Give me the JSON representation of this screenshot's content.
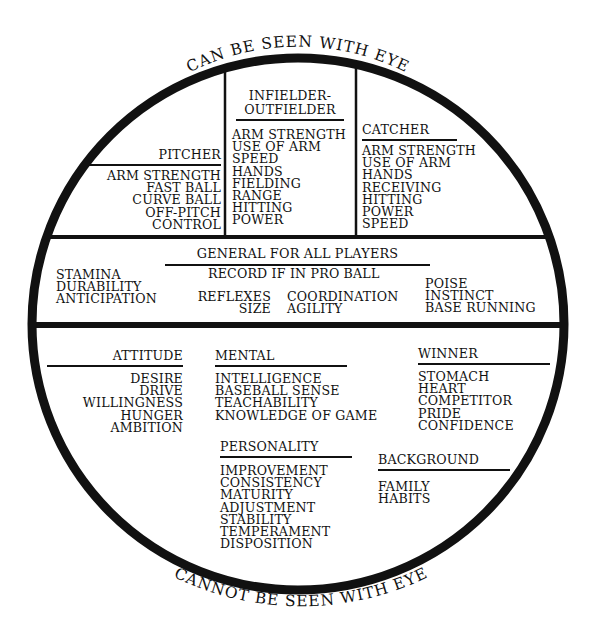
{
  "arc_labels": {
    "top": "CAN BE SEEN WITH EYE",
    "bottom": "CANNOT BE SEEN WITH EYE"
  },
  "top_section": {
    "pitcher": {
      "title": "PITCHER",
      "items": [
        "ARM STRENGTH",
        "FAST BALL",
        "CURVE BALL",
        "OFF-PITCH",
        "CONTROL"
      ]
    },
    "infielder_outfielder": {
      "title_line1": "INFIELDER-",
      "title_line2": "OUTFIELDER",
      "items": [
        "ARM STRENGTH",
        "USE OF ARM",
        "SPEED",
        "HANDS",
        "FIELDING",
        "RANGE",
        "HITTING",
        "POWER"
      ]
    },
    "catcher": {
      "title": "CATCHER",
      "items": [
        "ARM STRENGTH",
        "USE OF ARM",
        "HANDS",
        "RECEIVING",
        "HITTING",
        "POWER",
        "SPEED"
      ]
    }
  },
  "middle_section": {
    "title": "GENERAL FOR ALL PLAYERS",
    "left_items": [
      "STAMINA",
      "DURABILITY",
      "ANTICIPATION"
    ],
    "record": "RECORD IF IN PRO BALL",
    "center_left": [
      "REFLEXES",
      "SIZE"
    ],
    "center_right": [
      "COORDINATION",
      "AGILITY"
    ],
    "right_items": [
      "POISE",
      "INSTINCT",
      "BASE RUNNING"
    ]
  },
  "bottom_section": {
    "attitude": {
      "title": "ATTITUDE",
      "items": [
        "DESIRE",
        "DRIVE",
        "WILLINGNESS",
        "HUNGER",
        "AMBITION"
      ]
    },
    "mental": {
      "title": "MENTAL",
      "items": [
        "INTELLIGENCE",
        "BASEBALL SENSE",
        "TEACHABILITY",
        "KNOWLEDGE OF GAME"
      ]
    },
    "winner": {
      "title": "WINNER",
      "items": [
        "STOMACH",
        "HEART",
        "COMPETITOR",
        "PRIDE",
        "CONFIDENCE"
      ]
    },
    "personality": {
      "title": "PERSONALITY",
      "items": [
        "IMPROVEMENT",
        "CONSISTENCY",
        "MATURITY",
        "ADJUSTMENT",
        "STABILITY",
        "TEMPERAMENT",
        "DISPOSITION"
      ]
    },
    "background": {
      "title": "BACKGROUND",
      "items": [
        "FAMILY",
        "HABITS"
      ]
    }
  }
}
